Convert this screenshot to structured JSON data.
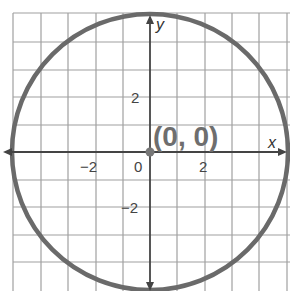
{
  "figure": {
    "type": "coordinate-grid-circle",
    "axes": {
      "x_label": "x",
      "y_label": "y",
      "x_ticks": [
        {
          "value": -2,
          "label": "−2"
        },
        {
          "value": 0,
          "label": "0"
        },
        {
          "value": 2,
          "label": "2"
        }
      ],
      "y_ticks": [
        {
          "value": 2,
          "label": "2"
        },
        {
          "value": -2,
          "label": "−2"
        }
      ],
      "range": [
        -5,
        5
      ],
      "grid_unit": 1
    },
    "circle": {
      "center": [
        0,
        0
      ],
      "radius": 5,
      "stroke_color": "#6a6a6a"
    },
    "center_point": {
      "label": "(0, 0)",
      "color": "#777777"
    },
    "colors": {
      "grid": "#9a9a9a",
      "axis": "#444444",
      "background": "#ffffff"
    }
  },
  "labels": {
    "x_axis": "x",
    "y_axis": "y",
    "x_tick_neg2": "−2",
    "x_tick_0": "0",
    "x_tick_2": "2",
    "y_tick_2": "2",
    "y_tick_neg2": "−2",
    "center": "(0, 0)"
  }
}
